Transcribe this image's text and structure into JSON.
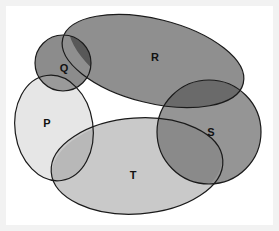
{
  "figure": {
    "kind": "venn-diagram",
    "title": "",
    "background_color": "#ffffff",
    "page_color": "#f2f2f2",
    "outline_color": "#1a1a1a",
    "outline_width": 1.2
  },
  "sets": [
    {
      "id": "P",
      "label": "P",
      "shape": "ellipse",
      "fill": "#e6e6e6",
      "label_color": "#111111",
      "cx": 48,
      "cy": 122,
      "rx": 39,
      "ry": 53,
      "rotate": -8
    },
    {
      "id": "Q",
      "label": "Q",
      "shape": "circle",
      "fill": "#8c8c8c",
      "label_color": "#111111",
      "cx": 57,
      "cy": 57,
      "rx": 28,
      "ry": 28,
      "rotate": 0
    },
    {
      "id": "R",
      "label": "R",
      "shape": "ellipse",
      "fill": "#8f8f8f",
      "label_color": "#111111",
      "cx": 147,
      "cy": 55,
      "rx": 93,
      "ry": 42,
      "rotate": 14
    },
    {
      "id": "S",
      "label": "S",
      "shape": "circle",
      "fill": "#959595",
      "label_color": "#111111",
      "cx": 203,
      "cy": 126,
      "rx": 52,
      "ry": 52,
      "rotate": 0
    },
    {
      "id": "T",
      "label": "T",
      "shape": "ellipse",
      "fill": "#c9c9c9",
      "label_color": "#111111",
      "cx": 131,
      "cy": 160,
      "rx": 86,
      "ry": 48,
      "rotate": -4
    }
  ],
  "label_positions": [
    {
      "id": "P",
      "label": "P",
      "x": 41,
      "y": 118
    },
    {
      "id": "Q",
      "label": "Q",
      "x": 58,
      "y": 63
    },
    {
      "id": "R",
      "label": "R",
      "x": 149,
      "y": 52
    },
    {
      "id": "S",
      "label": "S",
      "x": 205,
      "y": 127
    },
    {
      "id": "T",
      "label": "T",
      "x": 127,
      "y": 170
    }
  ],
  "intersections": [
    {
      "id": "Q-R",
      "sets": [
        "Q",
        "R"
      ],
      "fill": "#585858",
      "description": "Q intersect R"
    },
    {
      "id": "Q-P",
      "sets": [
        "Q",
        "P"
      ],
      "fill": "#9a9a9a",
      "description": "Q intersect P"
    },
    {
      "id": "R-S",
      "sets": [
        "R",
        "S"
      ],
      "fill": "#6a6a6a",
      "description": "R intersect S"
    },
    {
      "id": "S-T",
      "sets": [
        "S",
        "T"
      ],
      "fill": "#8a8a8a",
      "description": "S intersect T"
    },
    {
      "id": "P-T",
      "sets": [
        "P",
        "T"
      ],
      "fill": "#b8b8b8",
      "description": "P intersect T"
    }
  ]
}
